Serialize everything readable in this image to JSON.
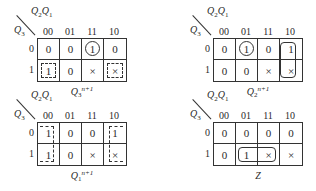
{
  "maps": [
    {
      "id": "q3",
      "caption": {
        "base": "Q",
        "sub": "3",
        "sup": "n+1"
      },
      "row_var": {
        "base": "Q",
        "sub": "3"
      },
      "col_var": {
        "a": "Q",
        "a_sub": "2",
        "b": "Q",
        "b_sub": "1"
      },
      "columns": [
        "00",
        "01",
        "11",
        "10"
      ],
      "rows": [
        "0",
        "1"
      ],
      "cells": [
        [
          "0",
          "0",
          "1",
          "0"
        ],
        [
          "1",
          "0",
          "×",
          "×"
        ]
      ]
    },
    {
      "id": "q2",
      "caption": {
        "base": "Q",
        "sub": "2",
        "sup": "n+1"
      },
      "row_var": {
        "base": "Q",
        "sub": "3"
      },
      "col_var": {
        "a": "Q",
        "a_sub": "2",
        "b": "Q",
        "b_sub": "1"
      },
      "columns": [
        "00",
        "01",
        "11",
        "10"
      ],
      "rows": [
        "0",
        "1"
      ],
      "cells": [
        [
          "0",
          "1",
          "0",
          "1"
        ],
        [
          "0",
          "0",
          "×",
          "×"
        ]
      ]
    },
    {
      "id": "q1",
      "caption": {
        "base": "Q",
        "sub": "1",
        "sup": "n+1"
      },
      "row_var": {
        "base": "Q",
        "sub": "3"
      },
      "col_var": {
        "a": "Q",
        "a_sub": "2",
        "b": "Q",
        "b_sub": "1"
      },
      "columns": [
        "00",
        "01",
        "11",
        "10"
      ],
      "rows": [
        "0",
        "1"
      ],
      "cells": [
        [
          "1",
          "0",
          "0",
          "1"
        ],
        [
          "1",
          "0",
          "×",
          "×"
        ]
      ]
    },
    {
      "id": "z",
      "caption": {
        "base": "Z",
        "sub": "",
        "sup": ""
      },
      "row_var": {
        "base": "Q",
        "sub": "3"
      },
      "col_var": {
        "a": "Q",
        "a_sub": "2",
        "b": "Q",
        "b_sub": "1"
      },
      "columns": [
        "00",
        "01",
        "11",
        "10"
      ],
      "rows": [
        "0",
        "1"
      ],
      "cells": [
        [
          "0",
          "0",
          "0",
          "0"
        ],
        [
          "0",
          "1",
          "×",
          "×"
        ]
      ]
    }
  ]
}
